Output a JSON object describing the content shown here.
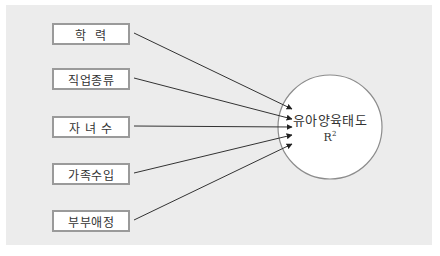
{
  "diagram": {
    "type": "path-model",
    "predictors": [
      {
        "label": "학  력"
      },
      {
        "label": "직업종류"
      },
      {
        "label": "자 녀 수"
      },
      {
        "label": "가족수입"
      },
      {
        "label": "부부애정"
      }
    ],
    "outcome": {
      "label": "유아양육태도",
      "stat_base": "R",
      "stat_sup": "2"
    },
    "colors": {
      "panel": "#ececec",
      "box_border": "#9a9a9a",
      "line": "#333333",
      "circle_border": "#8c8c8c"
    }
  }
}
